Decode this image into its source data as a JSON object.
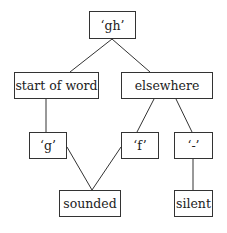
{
  "diagram": {
    "nodes": {
      "root": {
        "label": "‘gh’"
      },
      "start": {
        "label": "start of word"
      },
      "else": {
        "label": "elsewhere"
      },
      "g": {
        "label": "‘g’"
      },
      "f": {
        "label": "‘f’"
      },
      "dash": {
        "label": "‘-’"
      },
      "sounded": {
        "label": "sounded"
      },
      "silent": {
        "label": "silent"
      }
    },
    "edges": [
      [
        "root",
        "start"
      ],
      [
        "root",
        "else"
      ],
      [
        "start",
        "g"
      ],
      [
        "else",
        "f"
      ],
      [
        "else",
        "dash"
      ],
      [
        "g",
        "sounded"
      ],
      [
        "f",
        "sounded"
      ],
      [
        "dash",
        "silent"
      ]
    ],
    "colors": {
      "line": "#333333",
      "text": "#222222",
      "background": "#ffffff"
    }
  }
}
